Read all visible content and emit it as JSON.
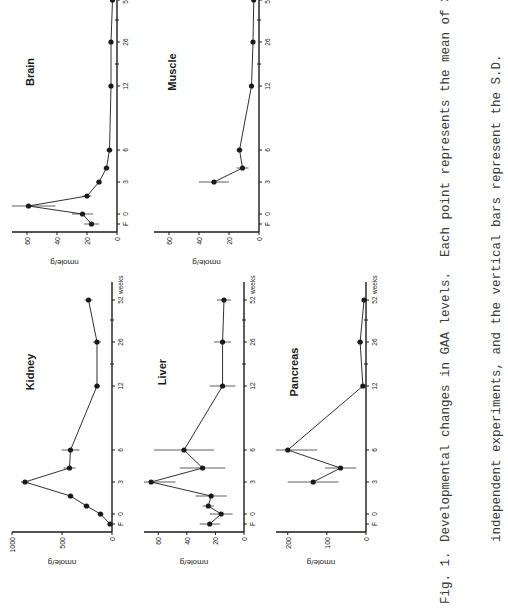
{
  "figure": {
    "caption_label": "Fig. 1.",
    "caption_line1": "Developmental changes in GAA levels.  Each point represents the mean of 3 to 5",
    "caption_line2": "independent experiments, and the vertical bars represent the S.D."
  },
  "axis_common": {
    "x_tick_labels": [
      "F",
      "0",
      "3",
      "6",
      "12",
      "26",
      "52"
    ],
    "x_unit_label": "weeks",
    "y_label": "nmole/g"
  },
  "chart_data": [
    {
      "type": "line",
      "title": "Kidney",
      "xlabel": "weeks",
      "ylabel": "nmole/g",
      "x": [
        "F",
        "0",
        "1",
        "2",
        "3",
        "4",
        "6",
        "12",
        "26",
        "52"
      ],
      "values": [
        20,
        115,
        255,
        415,
        870,
        425,
        415,
        150,
        150,
        235
      ],
      "error": [
        10,
        30,
        30,
        30,
        40,
        60,
        90,
        30,
        40,
        40
      ],
      "y_ticks": [
        "0",
        "500",
        "1000"
      ],
      "ylim": [
        0,
        1000
      ]
    },
    {
      "type": "line",
      "title": "Liver",
      "xlabel": "weeks",
      "ylabel": "nmole/g",
      "x": [
        "F",
        "0",
        "1",
        "2",
        "3",
        "4",
        "6",
        "12",
        "26",
        "52"
      ],
      "values": [
        24,
        16,
        25,
        23,
        65,
        29,
        42,
        15,
        15,
        14
      ],
      "error": [
        7,
        8,
        4,
        11,
        17,
        16,
        21,
        9,
        6,
        5
      ],
      "y_ticks": [
        "0",
        "20",
        "40",
        "60"
      ],
      "ylim": [
        0,
        70
      ]
    },
    {
      "type": "line",
      "title": "Pancreas",
      "xlabel": "weeks",
      "ylabel": "nmole/g",
      "x": [
        "3",
        "4",
        "6",
        "12",
        "26",
        "52"
      ],
      "values": [
        135,
        65,
        200,
        8,
        15,
        5
      ],
      "error": [
        65,
        40,
        75,
        3,
        8,
        3
      ],
      "y_ticks": [
        "0",
        "100",
        "200"
      ],
      "ylim": [
        0,
        230
      ]
    },
    {
      "type": "line",
      "title": "Brain",
      "xlabel": "weeks",
      "ylabel": "nmole/g",
      "x": [
        "F",
        "0",
        "1",
        "2",
        "3",
        "4",
        "6",
        "12",
        "26",
        "52"
      ],
      "values": [
        17,
        23,
        59,
        20,
        12,
        7,
        5,
        4,
        4,
        3
      ],
      "error": [
        5,
        7,
        18,
        3,
        2,
        2,
        2,
        1,
        1,
        1
      ],
      "y_ticks": [
        "0",
        "20",
        "40",
        "60"
      ],
      "ylim": [
        0,
        70
      ]
    },
    {
      "type": "line",
      "title": "Muscle",
      "xlabel": "weeks",
      "ylabel": "nmole/g",
      "x": [
        "3",
        "4",
        "6",
        "12",
        "26",
        "52"
      ],
      "values": [
        30,
        11,
        13,
        5,
        4,
        3.5
      ],
      "error": [
        10,
        4,
        2,
        1,
        1,
        1
      ],
      "y_ticks": [
        "0",
        "20",
        "40",
        "60"
      ],
      "ylim": [
        0,
        70
      ]
    }
  ],
  "colors": {
    "ink": "#1a1a1a",
    "paper": "#ffffff",
    "caption": "#3a3a3a"
  }
}
